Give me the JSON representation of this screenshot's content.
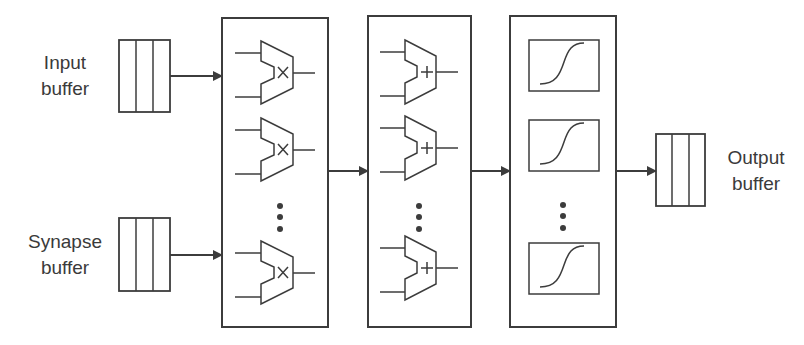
{
  "labels": {
    "input_buffer": [
      "Input",
      "buffer"
    ],
    "synapse_buffer": [
      "Synapse",
      "buffer"
    ],
    "output_buffer": [
      "Output",
      "buffer"
    ]
  },
  "stages": [
    {
      "name": "multiplier-stage",
      "unit": "multiplier",
      "symbol": "×",
      "visible_units": 3,
      "ellipsis": true
    },
    {
      "name": "adder-stage",
      "unit": "adder",
      "symbol": "+",
      "visible_units": 3,
      "ellipsis": true
    },
    {
      "name": "activation-stage",
      "unit": "sigmoid",
      "symbol": "sigmoid-curve",
      "visible_units": 3,
      "ellipsis": true
    }
  ],
  "buffer_cells": 3,
  "colors": {
    "stroke": "#3c3c3c",
    "text": "#3a3a3a",
    "background": "#ffffff"
  }
}
